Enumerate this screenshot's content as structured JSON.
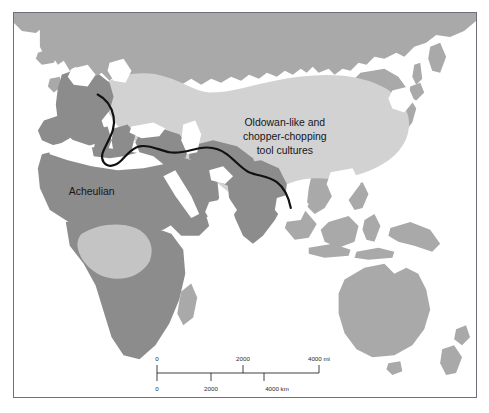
{
  "figure": {
    "type": "thematic-map"
  },
  "labels": {
    "acheulian": {
      "text": "Acheulian",
      "lines": [
        "Acheulian"
      ]
    },
    "oldowan": {
      "text": "Oldowan-like and chopper-chopping tool cultures",
      "lines": [
        "Oldowan-like and",
        "chopper-chopping",
        "tool cultures"
      ]
    }
  },
  "legend_regions": [
    {
      "name": "Acheulian",
      "fill": "#8c8c8c",
      "description": "dark grey landmass region, Africa through Europe, Near East and India"
    },
    {
      "name": "Oldowan-like and chopper-chopping tool cultures",
      "fill": "#d2d2d2",
      "description": "light grey region, central and east Asia"
    },
    {
      "name": "Other land",
      "fill": "#a9a9a9",
      "description": "medium grey land outside either tradition"
    },
    {
      "name": "Ocean",
      "fill": "#ffffff",
      "description": "white sea areas"
    }
  ],
  "boundary": {
    "name": "Movius Line",
    "stroke": "#111111",
    "visible": true,
    "description": "heavy black line dividing Acheulian from chopper-chopping tool area"
  },
  "scale": {
    "miles": {
      "unit": "mi",
      "unit_label": "4000 mi",
      "ticks": [
        "0",
        "2000",
        "4000 mi"
      ],
      "tick_values": [
        0,
        2000,
        4000
      ]
    },
    "kilometres": {
      "unit": "km",
      "unit_label": "4000 km",
      "ticks": [
        "0",
        "2000",
        "4000 km"
      ],
      "tick_values": [
        0,
        2000,
        4000
      ]
    }
  },
  "colors": {
    "frame": "#6f6f78",
    "land_dark": "#8c8c8c",
    "land_mid": "#a9a9a9",
    "zone_light": "#d2d2d2",
    "ocean": "#ffffff",
    "ink": "#16161a"
  }
}
